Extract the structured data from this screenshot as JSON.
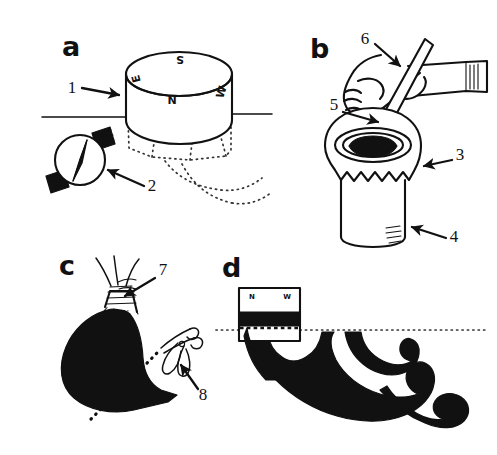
{
  "figure": {
    "ink_color": "#111111",
    "background_color": "#ffffff",
    "panels": [
      {
        "letter": "a",
        "name": "collar-and-compass",
        "description": "Cylindrical collar set on the ground surface over a nest entrance, oriented with a compass; hidden burrow galleries shown as dotted lines below ground",
        "compass_labels": {
          "north": "N",
          "south": "S",
          "east": "E",
          "west": "W"
        },
        "callouts": [
          {
            "number": "1",
            "target": "cylindrical-collar"
          },
          {
            "number": "2",
            "target": "wrist-compass"
          }
        ]
      },
      {
        "letter": "b",
        "name": "pouring-vessel",
        "description": "Hand holding a stirring rod inserted into the dark opening of a bell-mouthed mixing vessel",
        "callouts": [
          {
            "number": "3",
            "target": "vessel-bell-rim"
          },
          {
            "number": "4",
            "target": "vessel-body"
          },
          {
            "number": "5",
            "target": "hand-grip"
          },
          {
            "number": "6",
            "target": "stirring-rod"
          }
        ]
      },
      {
        "letter": "c",
        "name": "tied-bag",
        "description": "Filled dark bag closed at the neck with wound string; scissors cutting along a dotted line",
        "callouts": [
          {
            "number": "7",
            "target": "string-tie"
          },
          {
            "number": "8",
            "target": "scissors"
          }
        ]
      },
      {
        "letter": "d",
        "name": "excavated-cast",
        "description": "Cross-section of the recovered branching cast below the ground line, with the oriented collar block marked N and W",
        "compass_labels": {
          "north": "N",
          "west": "W"
        },
        "callouts": []
      }
    ]
  }
}
